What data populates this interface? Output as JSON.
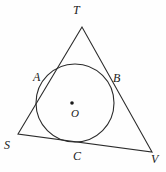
{
  "figure": {
    "background_color": "#fefefe",
    "stroke_color": "#2b2b2b",
    "label_color": "#1a1a1a",
    "stroke_width": 1.1,
    "canvas": {
      "width": 166,
      "height": 172
    }
  },
  "circle": {
    "name": "inscribed-circle",
    "center": {
      "x": 75,
      "y": 103
    },
    "radius": 39
  },
  "center_point": {
    "name": "circle-center-dot",
    "x": 72,
    "y": 103,
    "radius": 1.8
  },
  "triangle": {
    "name": "circumscribing-triangle",
    "vertices": [
      {
        "id": "T",
        "x": 82,
        "y": 27
      },
      {
        "id": "S",
        "x": 18,
        "y": 134
      },
      {
        "id": "V",
        "x": 152,
        "y": 152
      }
    ],
    "sides": [
      {
        "from": "T",
        "to": "S",
        "tangent_point": "A"
      },
      {
        "from": "T",
        "to": "V",
        "tangent_point": "B"
      },
      {
        "from": "S",
        "to": "V",
        "tangent_point": "C"
      }
    ]
  },
  "tangent_points": [
    {
      "id": "A",
      "x": 47,
      "y": 81
    },
    {
      "id": "B",
      "x": 108,
      "y": 80
    },
    {
      "id": "C",
      "x": 78,
      "y": 144
    }
  ],
  "labels": {
    "T": "T",
    "A": "A",
    "B": "B",
    "S": "S",
    "C": "C",
    "V": "V",
    "O": "O"
  }
}
